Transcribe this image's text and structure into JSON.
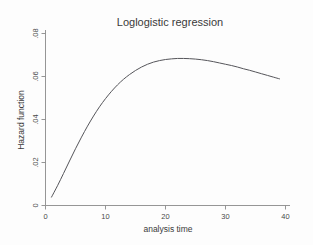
{
  "chart_data": {
    "type": "line",
    "title": "Loglogistic regression",
    "xlabel": "analysis time",
    "ylabel": "Hazard function",
    "xlim": [
      0,
      41
    ],
    "ylim": [
      0,
      0.0855
    ],
    "grid": false,
    "legend": null,
    "xticks": [
      0,
      10,
      20,
      30,
      40
    ],
    "xtick_labels": [
      "0",
      "10",
      "20",
      "30",
      "40"
    ],
    "yticks": [
      0,
      0.02,
      0.04,
      0.06,
      0.08
    ],
    "ytick_labels": [
      "0",
      ".02",
      ".04",
      ".06",
      ".08"
    ],
    "series": [
      {
        "name": "Hazard function",
        "color": "#55555a",
        "x": [
          1,
          2,
          3,
          4,
          5,
          6,
          7,
          8,
          9,
          10,
          11,
          12,
          13,
          14,
          15,
          16,
          17,
          18,
          19,
          20,
          21,
          22,
          23,
          24,
          25,
          26,
          27,
          28,
          29,
          30,
          31,
          32,
          33,
          34,
          35,
          36,
          37,
          38,
          39
        ],
        "y": [
          0.0039,
          0.0092,
          0.0149,
          0.0207,
          0.0264,
          0.0318,
          0.0369,
          0.0416,
          0.0459,
          0.0497,
          0.0531,
          0.0561,
          0.0587,
          0.0609,
          0.0628,
          0.0644,
          0.0657,
          0.0667,
          0.0674,
          0.0679,
          0.0682,
          0.0684,
          0.0684,
          0.0683,
          0.0681,
          0.0678,
          0.0674,
          0.0669,
          0.0663,
          0.0657,
          0.0651,
          0.0644,
          0.0636,
          0.0629,
          0.0621,
          0.0613,
          0.0605,
          0.0597,
          0.0589
        ]
      }
    ],
    "peak": {
      "x": 18.5,
      "y": 0.0725
    },
    "start_point": {
      "x": 1,
      "y": 0.0039
    },
    "end_point": {
      "x": 39,
      "y": 0.0537
    }
  },
  "colors": {
    "background": "#fdfdfd",
    "curve": "#55555a",
    "axis": "#8a8a8a",
    "text": "#3a3a3a"
  }
}
